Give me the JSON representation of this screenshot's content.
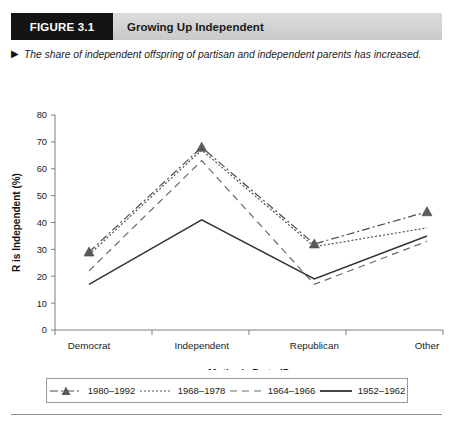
{
  "figure": {
    "tag": "FIGURE 3.1",
    "title": "Growing Up Independent",
    "caption_marker": "▶",
    "caption": "The share of independent offspring of partisan and independent parents has increased."
  },
  "chart_data": {
    "type": "line",
    "title": "",
    "xlabel": "Mother's Party ID",
    "ylabel": "R is Independent (%)",
    "categories": [
      "Democrat",
      "Independent",
      "Republican",
      "Other"
    ],
    "ylim": [
      0,
      80
    ],
    "yticks": [
      0,
      10,
      20,
      30,
      40,
      50,
      60,
      70,
      80
    ],
    "grid": false,
    "legend_position": "bottom",
    "series": [
      {
        "name": "1980–1992",
        "values": [
          29,
          68,
          32,
          44
        ],
        "style": "dash-dot",
        "marker": "triangle",
        "color": "#4a4a4a"
      },
      {
        "name": "1968–1978",
        "values": [
          28,
          67,
          31,
          38
        ],
        "style": "dotted",
        "marker": "none",
        "color": "#555555"
      },
      {
        "name": "1964–1966",
        "values": [
          22,
          63,
          17,
          33
        ],
        "style": "dashed",
        "marker": "none",
        "color": "#6a6a6a"
      },
      {
        "name": "1952–1962",
        "values": [
          17,
          41,
          19,
          35
        ],
        "style": "solid",
        "marker": "none",
        "color": "#333333"
      }
    ]
  },
  "colors": {
    "header_bar": "#d4d4d4",
    "tag_block": "#141414",
    "axis": "#7d7d7d"
  }
}
